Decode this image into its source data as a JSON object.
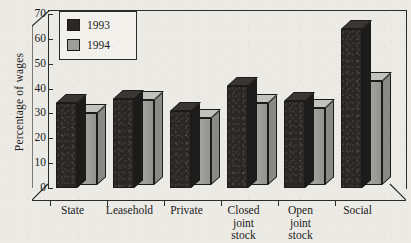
{
  "chart_data": {
    "type": "bar",
    "title": "",
    "xlabel": "",
    "ylabel": "Percentage of wages",
    "ylim": [
      0,
      70
    ],
    "yticks": [
      0,
      10,
      20,
      30,
      40,
      50,
      60,
      70
    ],
    "grid": false,
    "legend_position": "top-left",
    "categories": [
      "State",
      "Leasehold",
      "Private",
      "Closed joint stock",
      "Open joint stock",
      "Social"
    ],
    "category_lines": [
      [
        "State"
      ],
      [
        "Leasehold"
      ],
      [
        "Private"
      ],
      [
        "Closed",
        "joint",
        "stock"
      ],
      [
        "Open",
        "joint",
        "stock"
      ],
      [
        "Social"
      ]
    ],
    "series": [
      {
        "name": "1993",
        "color": "#2a2724",
        "values": [
          34,
          36,
          31,
          41,
          35,
          64
        ]
      },
      {
        "name": "1994",
        "color": "#9e9e99",
        "values": [
          29,
          34,
          27,
          33,
          31,
          42
        ]
      }
    ]
  },
  "legend": {
    "items": [
      {
        "label": "1993",
        "swatch": "black-square-swatch"
      },
      {
        "label": "1994",
        "swatch": "gray-square-swatch"
      }
    ]
  },
  "axis": {
    "y_label": "Percentage of wages",
    "y_tick_labels": [
      "70",
      "60",
      "50",
      "40",
      "30",
      "20",
      "10",
      "0"
    ]
  }
}
